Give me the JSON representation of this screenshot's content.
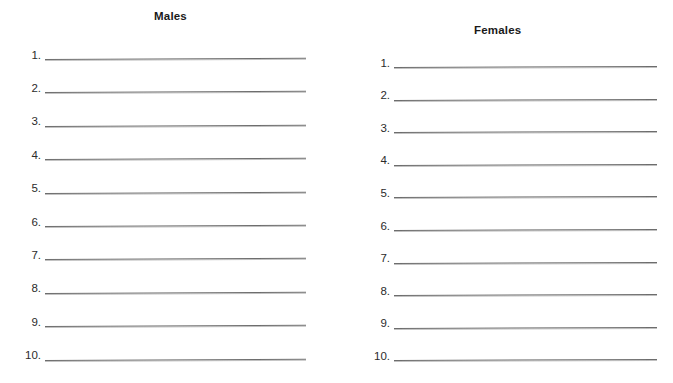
{
  "page": {
    "background_color": "#ffffff",
    "rule_color": "#6d6d6d",
    "text_color": "#1a1a1a",
    "width": 673,
    "height": 383
  },
  "columns": [
    {
      "id": "males",
      "heading": "Males",
      "rows": [
        {
          "number": "1."
        },
        {
          "number": "2."
        },
        {
          "number": "3."
        },
        {
          "number": "4."
        },
        {
          "number": "5."
        },
        {
          "number": "6."
        },
        {
          "number": "7."
        },
        {
          "number": "8."
        },
        {
          "number": "9."
        },
        {
          "number": "10."
        }
      ]
    },
    {
      "id": "females",
      "heading": "Females",
      "rows": [
        {
          "number": "1."
        },
        {
          "number": "2."
        },
        {
          "number": "3."
        },
        {
          "number": "4."
        },
        {
          "number": "5."
        },
        {
          "number": "6."
        },
        {
          "number": "7."
        },
        {
          "number": "8."
        },
        {
          "number": "9."
        },
        {
          "number": "10."
        }
      ]
    }
  ]
}
